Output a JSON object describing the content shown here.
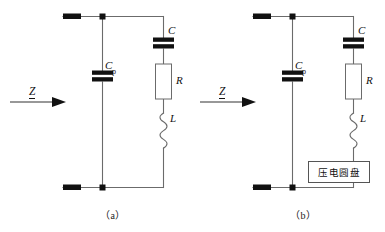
{
  "figure": {
    "type": "electrical-schematic",
    "background_color": "#ffffff",
    "wire_color": "#6b6b6b",
    "plate_color": "#111111",
    "box_border_color": "#555555"
  },
  "panels": [
    {
      "id": "a",
      "caption": "（a）",
      "input_label": "Z",
      "components": [
        {
          "name": "parallel-capacitor",
          "label": "C",
          "subscript": "p",
          "kind": "capacitor"
        },
        {
          "name": "series-capacitor",
          "label": "C",
          "subscript": "",
          "kind": "capacitor"
        },
        {
          "name": "series-resistor",
          "label": "R",
          "subscript": "",
          "kind": "resistor"
        },
        {
          "name": "series-inductor",
          "label": "L",
          "subscript": "",
          "kind": "inductor"
        }
      ]
    },
    {
      "id": "b",
      "caption": "（b）",
      "input_label": "Z",
      "components": [
        {
          "name": "parallel-capacitor",
          "label": "C",
          "subscript": "p",
          "kind": "capacitor"
        },
        {
          "name": "series-capacitor",
          "label": "C",
          "subscript": "",
          "kind": "capacitor"
        },
        {
          "name": "series-resistor",
          "label": "R",
          "subscript": "",
          "kind": "resistor"
        },
        {
          "name": "series-inductor",
          "label": "L",
          "subscript": "",
          "kind": "inductor"
        },
        {
          "name": "piezo-disc-block",
          "label": "压电圆盘",
          "subscript": "",
          "kind": "block"
        }
      ],
      "block_label": "压电圆盘"
    }
  ]
}
